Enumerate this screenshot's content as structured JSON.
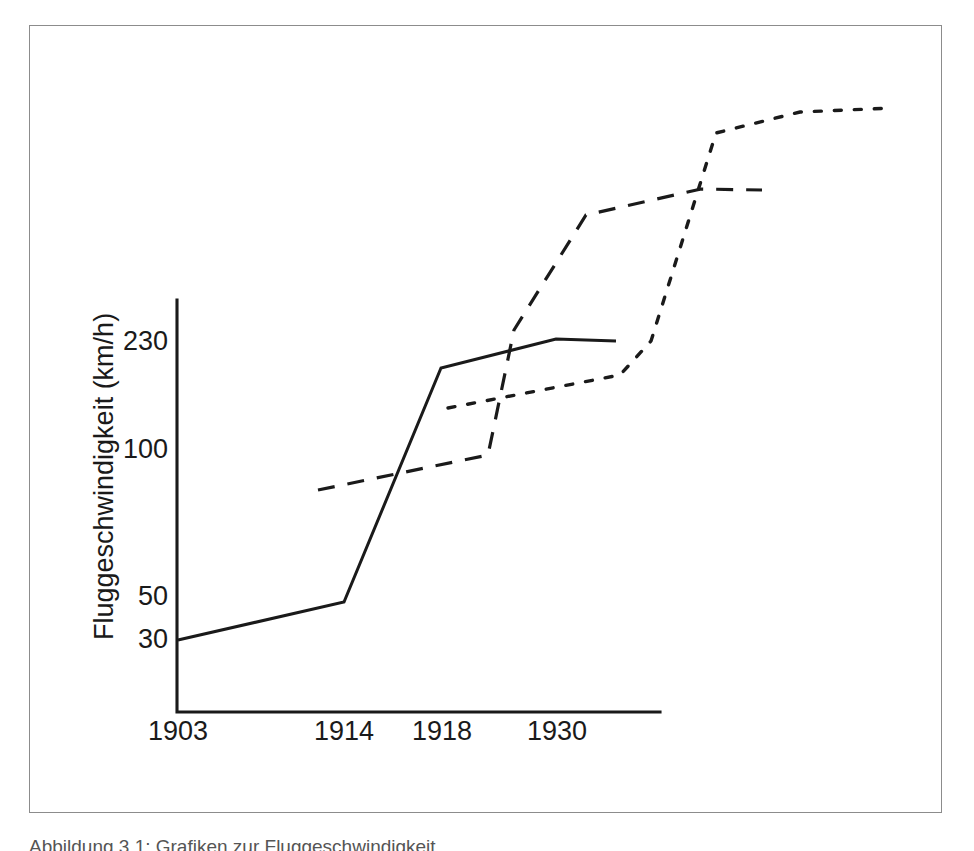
{
  "figure": {
    "background_color": "#ffffff",
    "ink_color": "#1a1a1a",
    "frame_color": "#8c8c8c",
    "caption_partial": "Abbildung 3.1: Grafiken zur Fluggeschwindigkeit"
  },
  "chart_data": {
    "type": "line",
    "title": "",
    "xlabel": "",
    "ylabel": "Fluggeschwindigkeit (km/h)",
    "grid": false,
    "legend": "none",
    "x_tick_labels": [
      "1903",
      "1914",
      "1918",
      "1930"
    ],
    "x_tick_pixels": [
      178,
      344,
      442,
      557
    ],
    "y_tick_labels": [
      "230",
      "100",
      "50",
      "30"
    ],
    "y_tick_values": [
      230,
      100,
      50,
      30
    ],
    "y_tick_pixels": [
      340,
      448,
      595,
      638
    ],
    "axis": {
      "x_origin_px": 177,
      "x_end_px": 660,
      "y_top_px": 300,
      "y_bottom_px": 712
    },
    "series": [
      {
        "name": "solid-series",
        "style": "solid",
        "points_px": [
          [
            178,
            640
          ],
          [
            344,
            602
          ],
          [
            441,
            368
          ],
          [
            556,
            339
          ],
          [
            616,
            341
          ]
        ],
        "points_data": [
          {
            "x": "1903",
            "y": 30
          },
          {
            "x": "1914",
            "y": 50
          },
          {
            "x": "1918",
            "y": 220
          },
          {
            "x": "1930",
            "y": 232
          },
          {
            "x": "after-1930",
            "y": 231
          }
        ]
      },
      {
        "name": "dashed-series",
        "style": "dashed",
        "points_px": [
          [
            318,
            490
          ],
          [
            488,
            455
          ],
          [
            514,
            330
          ],
          [
            586,
            215
          ],
          [
            701,
            189
          ],
          [
            762,
            190
          ]
        ],
        "points_data": [
          {
            "x": "~1913",
            "y": 78
          },
          {
            "x": "~1919",
            "y": 95
          },
          {
            "x": "~1920",
            "y": 150
          },
          {
            "x": "~1923",
            "y": 290
          },
          {
            "x": "~1932",
            "y": 330
          },
          {
            "x": "end",
            "y": 329
          }
        ]
      },
      {
        "name": "dotted-series",
        "style": "dotted",
        "points_px": [
          [
            448,
            408
          ],
          [
            620,
            375
          ],
          [
            651,
            341
          ],
          [
            716,
            133
          ],
          [
            800,
            112
          ],
          [
            893,
            108
          ]
        ],
        "points_data": [
          {
            "x": "~1918",
            "y": 160
          },
          {
            "x": "~1926",
            "y": 175
          },
          {
            "x": "~1928",
            "y": 231
          },
          {
            "x": "~1931",
            "y": 380
          },
          {
            "x": "~1936",
            "y": 400
          },
          {
            "x": "end",
            "y": 405
          }
        ]
      }
    ]
  }
}
